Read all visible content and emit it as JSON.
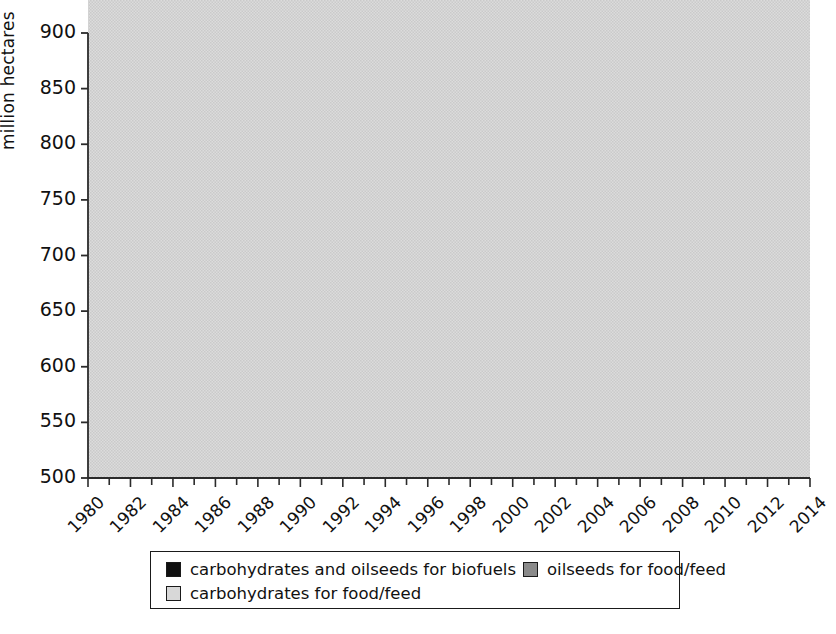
{
  "chart_data": {
    "type": "area",
    "title": "",
    "xlabel": "",
    "ylabel": "million hectares",
    "stacked": true,
    "grid": false,
    "legend_position": "bottom",
    "xlim": [
      1980,
      2014
    ],
    "ylim": [
      500,
      900
    ],
    "ytick_labels": [
      "500",
      "550",
      "600",
      "650",
      "700",
      "750",
      "800",
      "850",
      "900"
    ],
    "ytick_values": [
      500,
      550,
      600,
      650,
      700,
      750,
      800,
      850,
      900
    ],
    "xtick_labels": [
      "1980",
      "1982",
      "1984",
      "1986",
      "1988",
      "1990",
      "1992",
      "1994",
      "1996",
      "1998",
      "2000",
      "2002",
      "2004",
      "2006",
      "2008",
      "2010",
      "2012",
      "2014"
    ],
    "xtick_values": [
      1980,
      1982,
      1984,
      1986,
      1988,
      1990,
      1992,
      1994,
      1996,
      1998,
      2000,
      2002,
      2004,
      2006,
      2008,
      2010,
      2012,
      2014
    ],
    "minor_xticks_every": 1,
    "x": [
      1980,
      1981,
      1982,
      1983,
      1984,
      1985,
      1986,
      1987,
      1988,
      1989,
      1990,
      1991,
      1992,
      1993,
      1994,
      1995,
      1996,
      1997,
      1998,
      1999,
      2000,
      2001,
      2002,
      2003,
      2004,
      2005,
      2006,
      2007,
      2008,
      2009,
      2010,
      2011,
      2012,
      2013,
      2014
    ],
    "series": [
      {
        "name": "carbohydrates for food/feed",
        "color": "#d8d8d8",
        "values": [
          624,
          628,
          621,
          609,
          613,
          616,
          614,
          604,
          603,
          608,
          611,
          612,
          612,
          610,
          613,
          612,
          614,
          620,
          618,
          615,
          607,
          598,
          600,
          606,
          617,
          616,
          614,
          612,
          611,
          609,
          607,
          604,
          601,
          597,
          593
        ]
      },
      {
        "name": "oilseeds for food/feed",
        "color": "#8a8a8a",
        "values": [
          74,
          75,
          73,
          77,
          85,
          88,
          89,
          96,
          96,
          106,
          108,
          108,
          110,
          111,
          115,
          119,
          123,
          124,
          123,
          122,
          126,
          130,
          131,
          145,
          151,
          155,
          159,
          163,
          167,
          171,
          176,
          181,
          186,
          192,
          197
        ]
      },
      {
        "name": "carbohydrates and oilseeds for biofuels",
        "color": "#101010",
        "values": [
          2,
          2,
          2,
          2,
          2,
          2,
          2,
          2,
          3,
          3,
          3,
          3,
          3,
          3,
          4,
          4,
          5,
          6,
          6,
          6,
          6,
          6,
          7,
          13,
          19,
          27,
          34,
          42,
          50,
          57,
          64,
          72,
          78,
          83,
          86
        ]
      }
    ],
    "totals": [
      700,
      705,
      696,
      688,
      700,
      706,
      705,
      702,
      702,
      717,
      722,
      723,
      725,
      724,
      732,
      735,
      742,
      750,
      747,
      743,
      739,
      734,
      738,
      764,
      787,
      798,
      807,
      817,
      828,
      837,
      847,
      857,
      865,
      872,
      876
    ]
  },
  "legend": {
    "items": [
      {
        "label": "carbohydrates and oilseeds for biofuels",
        "swatch": "sw-black"
      },
      {
        "label": "oilseeds for food/feed",
        "swatch": "sw-dark"
      },
      {
        "label": "carbohydrates for food/feed",
        "swatch": "sw-light"
      }
    ]
  },
  "axes": {
    "y_axis_title": "million hectares"
  }
}
